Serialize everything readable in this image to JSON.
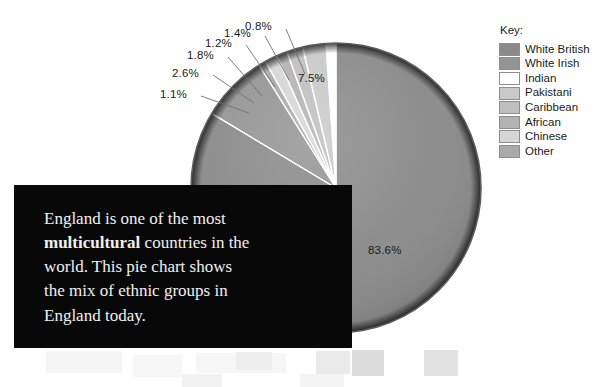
{
  "legend": {
    "title": "Key:",
    "items": [
      {
        "label": "White British",
        "color": "#8a8a8a"
      },
      {
        "label": "White Irish",
        "color": "#949494"
      },
      {
        "label": "Indian",
        "color": "#ffffff"
      },
      {
        "label": "Pakistani",
        "color": "#c9c9c9"
      },
      {
        "label": "Caribbean",
        "color": "#bfbfbf"
      },
      {
        "label": "African",
        "color": "#b3b3b3"
      },
      {
        "label": "Chinese",
        "color": "#d6d6d6"
      },
      {
        "label": "Other",
        "color": "#aaaaaa"
      }
    ]
  },
  "caption": {
    "part1": "England is one of the most ",
    "bold": "multicultural",
    "part2": " countries in the world. This pie chart shows the mix of ethnic groups in England today."
  },
  "chart_data": {
    "type": "pie",
    "title": "",
    "unit": "%",
    "categories": [
      "White British",
      "White Irish",
      "Indian",
      "Pakistani",
      "Caribbean",
      "African",
      "Chinese",
      "Other"
    ],
    "values": [
      83.6,
      7.5,
      1.1,
      2.6,
      1.8,
      1.2,
      1.4,
      0.8
    ],
    "labels": [
      "83.6%",
      "7.5%",
      "1.1%",
      "2.6%",
      "1.8%",
      "1.2%",
      "1.4%",
      "0.8%"
    ],
    "colors": [
      "#8a8a8a",
      "#949494",
      "#ffffff",
      "#c9c9c9",
      "#bfbfbf",
      "#b3b3b3",
      "#d6d6d6",
      "#aaaaaa"
    ],
    "legend": "Key:",
    "legend_position": "right",
    "start_angle_deg": 0,
    "direction": "clockwise",
    "grid": false,
    "inner_labels": [
      "83.6%",
      "7.5%"
    ],
    "callout_labels": [
      "1.1%",
      "2.6%",
      "1.8%",
      "1.2%",
      "1.4%",
      "0.8%"
    ]
  },
  "pie_labels": {
    "white_british": "83.6%",
    "white_irish": "7.5%",
    "indian": "1.1%",
    "pakistani": "2.6%",
    "caribbean": "1.8%",
    "african": "1.2%",
    "chinese": "1.4%",
    "other": "0.8%"
  }
}
